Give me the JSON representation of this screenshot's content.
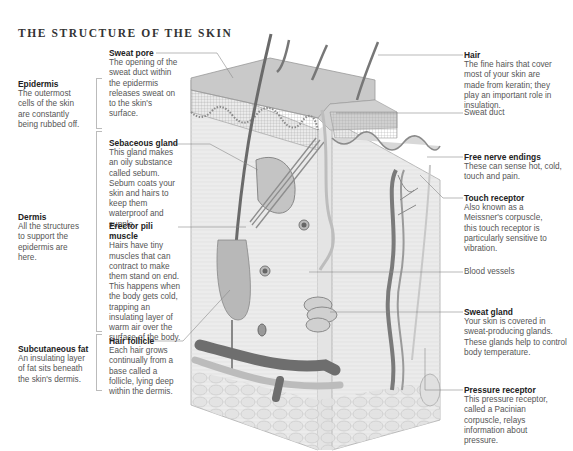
{
  "title": "THE STRUCTURE OF THE SKIN",
  "layers": [
    {
      "name": "Epidermis",
      "text": "The outermost cells of the skin are constantly being rubbed off."
    },
    {
      "name": "Dermis",
      "text": "All the structures to support the epidermis are here."
    },
    {
      "name": "Subcutaneous fat",
      "text": "An insulating layer of fat sits beneath the skin's dermis."
    }
  ],
  "left_labels": [
    {
      "name": "Sweat pore",
      "text": "The opening of the sweat duct within the epidermis releases sweat on to the skin's surface."
    },
    {
      "name": "Sebaceous gland",
      "text": "This gland makes an oily substance called sebum. Sebum coats your skin and hairs to keep them waterproof and supple."
    },
    {
      "name": "Erector pili muscle",
      "text": "Hairs have tiny muscles that can contract to make them stand on end. This happens when the body gets cold, trapping an insulating layer of warm air over the surface of the body."
    },
    {
      "name": "Hair follicle",
      "text": "Each hair grows continually from a base called a follicle, lying deep within the dermis."
    }
  ],
  "right_labels": [
    {
      "name": "Hair",
      "text": "The fine hairs that cover most of your skin are made from keratin; they play an important role in insulation."
    },
    {
      "name": "Sweat duct",
      "text": ""
    },
    {
      "name": "Free nerve endings",
      "text": "These can sense hot, cold, touch and pain."
    },
    {
      "name": "Touch receptor",
      "text": "Also known as a Meissner's corpuscle, this touch receptor is particularly sensitive to vibration."
    },
    {
      "name": "Blood vessels",
      "text": ""
    },
    {
      "name": "Sweat gland",
      "text": "Your skin is covered in sweat-producing glands. These glands help to control body temperature."
    },
    {
      "name": "Pressure receptor",
      "text": "This pressure receptor, called a Pacinian corpuscle, relays information about pressure."
    }
  ],
  "colors": {
    "ink": "#222222",
    "body_text": "#555555",
    "leader": "#888888",
    "skin_light": "#e6e6e6",
    "skin_mid": "#c8c8c8",
    "vessel": "#6e6e6e"
  }
}
